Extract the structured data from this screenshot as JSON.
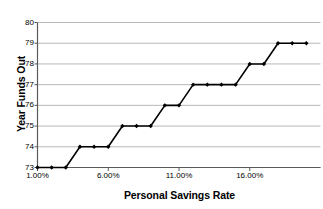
{
  "chart_data": {
    "type": "line",
    "title": "",
    "xlabel": "Personal Savings Rate",
    "ylabel": "Year Funds Out",
    "xlim": [
      1,
      21
    ],
    "ylim": [
      73,
      80
    ],
    "grid": true,
    "legend": "none",
    "marker": "diamond",
    "line_color": "#000000",
    "grid_color": "#a6a6a6",
    "axis_color": "#808080",
    "background": "#ffffff",
    "x_tick_labels": [
      "1.00%",
      "6.00%",
      "11.00%",
      "16.00%"
    ],
    "x_tick_values": [
      1,
      6,
      11,
      16
    ],
    "y_tick_labels": [
      "73",
      "74",
      "75",
      "76",
      "77",
      "78",
      "79",
      "80"
    ],
    "y_tick_values": [
      73,
      74,
      75,
      76,
      77,
      78,
      79,
      80
    ],
    "x": [
      1,
      2,
      3,
      4,
      5,
      6,
      7,
      8,
      9,
      10,
      11,
      12,
      13,
      14,
      15,
      16,
      17,
      18,
      19,
      20
    ],
    "values": [
      73,
      73,
      73,
      74,
      74,
      74,
      75,
      75,
      75,
      76,
      76,
      77,
      77,
      77,
      77,
      78,
      78,
      79,
      79,
      79
    ],
    "series": [
      {
        "name": "Year Funds Out",
        "points": [
          {
            "x": 1,
            "y": 73
          },
          {
            "x": 2,
            "y": 73
          },
          {
            "x": 3,
            "y": 73
          },
          {
            "x": 4,
            "y": 74
          },
          {
            "x": 5,
            "y": 74
          },
          {
            "x": 6,
            "y": 74
          },
          {
            "x": 7,
            "y": 75
          },
          {
            "x": 8,
            "y": 75
          },
          {
            "x": 9,
            "y": 75
          },
          {
            "x": 10,
            "y": 76
          },
          {
            "x": 11,
            "y": 76
          },
          {
            "x": 12,
            "y": 77
          },
          {
            "x": 13,
            "y": 77
          },
          {
            "x": 14,
            "y": 77
          },
          {
            "x": 15,
            "y": 77
          },
          {
            "x": 16,
            "y": 78
          },
          {
            "x": 17,
            "y": 78
          },
          {
            "x": 18,
            "y": 79
          },
          {
            "x": 19,
            "y": 79
          },
          {
            "x": 20,
            "y": 79
          }
        ]
      }
    ]
  },
  "axes": {
    "y_title": "Year Funds Out",
    "x_title": "Personal Savings Rate"
  }
}
